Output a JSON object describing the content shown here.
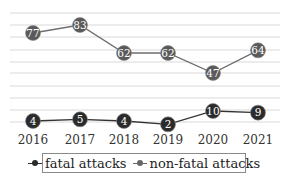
{
  "chart_data": {
    "type": "line",
    "title": "",
    "xlabel": "",
    "ylabel": "",
    "categories": [
      "2016",
      "2017",
      "2018",
      "2019",
      "2020",
      "2021"
    ],
    "series": [
      {
        "name": "fatal attacks",
        "values": [
          4,
          5,
          4,
          2,
          10,
          9
        ],
        "color": "#2b2b2b"
      },
      {
        "name": "non-fatal attacks",
        "values": [
          77,
          83,
          62,
          62,
          47,
          64
        ],
        "color": "#5a5a5a"
      }
    ],
    "data_labels": true,
    "grid": true,
    "y_axis_visible": false,
    "legend_position": "bottom"
  },
  "legend": {
    "items": [
      {
        "label": "fatal attacks",
        "color": "#2b2b2b"
      },
      {
        "label": "non-fatal attacks",
        "color": "#666666"
      }
    ]
  }
}
